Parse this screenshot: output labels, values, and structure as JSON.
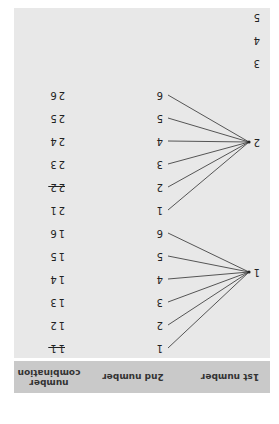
{
  "headers": {
    "first": "1st number",
    "second": "2nd number",
    "combo_line1": "number",
    "combo_line2": "combination"
  },
  "branches": [
    {
      "first": "1",
      "second": [
        "1",
        "2",
        "3",
        "4",
        "5",
        "6"
      ],
      "combos": [
        "11",
        "12",
        "13",
        "14",
        "15",
        "16"
      ],
      "struck": [
        true,
        false,
        false,
        false,
        false,
        false
      ]
    },
    {
      "first": "2",
      "second": [
        "1",
        "2",
        "3",
        "4",
        "5",
        "6"
      ],
      "combos": [
        "21",
        "22",
        "23",
        "24",
        "25",
        "26"
      ],
      "struck": [
        false,
        true,
        false,
        false,
        false,
        false
      ]
    }
  ],
  "remaining_first": [
    "3",
    "4",
    "5"
  ],
  "colors": {
    "panel": "#e8e8e8",
    "header": "#c9c9c9",
    "line": "#444444"
  }
}
